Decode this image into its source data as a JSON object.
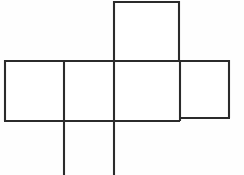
{
  "figure": {
    "kind": "geometric-net-diagram",
    "canvas": {
      "width": 244,
      "height": 175
    },
    "background_color": "#fefefe",
    "line_color": "#2b2b2b",
    "line_width_px": 2.1,
    "face_fill_color": "#ffffff",
    "labels": [],
    "faces": [
      {
        "name": "top-flap-square",
        "x": 113,
        "y": 1,
        "width": 67,
        "height": 59
      },
      {
        "name": "row-square-1-leftmost",
        "x": 4,
        "y": 60,
        "width": 60,
        "height": 61
      },
      {
        "name": "row-square-2",
        "x": 64,
        "y": 60,
        "width": 50,
        "height": 61
      },
      {
        "name": "row-square-3",
        "x": 114,
        "y": 60,
        "width": 66,
        "height": 61
      },
      {
        "name": "row-square-4-rightmost",
        "x": 180,
        "y": 60,
        "width": 50,
        "height": 58
      }
    ],
    "segments": [
      {
        "name": "top-flap-left-edge",
        "x1": 114,
        "y1": 1,
        "x2": 114,
        "y2": 60
      },
      {
        "name": "top-flap-top-edge",
        "x1": 113,
        "y1": 2,
        "x2": 180,
        "y2": 2
      },
      {
        "name": "top-flap-right-edge",
        "x1": 179,
        "y1": 1,
        "x2": 179,
        "y2": 60
      },
      {
        "name": "row-top-edge",
        "x1": 4,
        "y1": 61,
        "x2": 230,
        "y2": 61
      },
      {
        "name": "row-bottom-edge-left",
        "x1": 4,
        "y1": 121,
        "x2": 180,
        "y2": 121
      },
      {
        "name": "row-bottom-edge-right",
        "x1": 180,
        "y1": 118,
        "x2": 230,
        "y2": 118
      },
      {
        "name": "row-left-edge",
        "x1": 5,
        "y1": 60,
        "x2": 5,
        "y2": 121
      },
      {
        "name": "row-right-edge",
        "x1": 229,
        "y1": 60,
        "x2": 229,
        "y2": 118
      },
      {
        "name": "divider-1-extended-down",
        "x1": 64,
        "y1": 60,
        "x2": 64,
        "y2": 175
      },
      {
        "name": "divider-2-extended-down",
        "x1": 114,
        "y1": 60,
        "x2": 114,
        "y2": 175
      },
      {
        "name": "divider-3-vertical",
        "x1": 180,
        "y1": 60,
        "x2": 180,
        "y2": 121
      }
    ]
  }
}
